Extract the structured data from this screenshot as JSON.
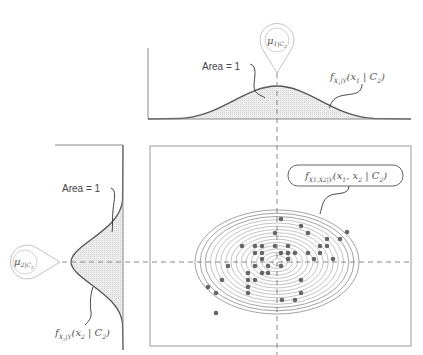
{
  "top_panel": {
    "area_label": "Area = 1",
    "mean_marker": {
      "symbol": "μ",
      "subscript": "1|C",
      "subsub": "2"
    },
    "curve_label": {
      "f": "f",
      "sub": "X",
      "subsub": "1",
      "sub2": "|Y",
      "args": "(x",
      "arg_sub": "1",
      "rest": " | C",
      "rest_sub": "2",
      "close": ")"
    }
  },
  "left_panel": {
    "area_label": "Area = 1",
    "mean_marker": {
      "symbol": "μ",
      "subscript": "2|C",
      "subsub": "2"
    },
    "curve_label": {
      "f": "f",
      "sub": "X",
      "subsub": "2",
      "sub2": "|Y",
      "args": "(x",
      "arg_sub": "2",
      "rest": " | C",
      "rest_sub": "2",
      "close": ")"
    }
  },
  "main_panel": {
    "joint_label": {
      "f": "f",
      "sub": "X1,X2|Y",
      "args": "(x",
      "arg1_sub": "1",
      "mid": ", x",
      "arg2_sub": "2",
      "rest": " | C",
      "rest_sub": "2",
      "close": ")"
    },
    "ellipse": {
      "cx": 277,
      "cy": 262,
      "rx": 82,
      "ry": 52,
      "rings": 16
    },
    "points": [
      [
        281,
        219
      ],
      [
        301,
        226
      ],
      [
        347,
        232
      ],
      [
        275,
        233
      ],
      [
        308,
        233
      ],
      [
        340,
        239
      ],
      [
        327,
        239
      ],
      [
        242,
        246
      ],
      [
        255,
        246
      ],
      [
        262,
        246
      ],
      [
        275,
        246
      ],
      [
        288,
        246
      ],
      [
        320,
        246
      ],
      [
        327,
        246
      ],
      [
        255,
        253
      ],
      [
        262,
        253
      ],
      [
        281,
        253
      ],
      [
        288,
        253
      ],
      [
        295,
        253
      ],
      [
        308,
        253
      ],
      [
        320,
        253
      ],
      [
        262,
        259
      ],
      [
        288,
        259
      ],
      [
        314,
        259
      ],
      [
        333,
        259
      ],
      [
        228,
        266
      ],
      [
        255,
        266
      ],
      [
        268,
        266
      ],
      [
        281,
        266
      ],
      [
        248,
        273
      ],
      [
        262,
        273
      ],
      [
        268,
        273
      ],
      [
        222,
        280
      ],
      [
        248,
        280
      ],
      [
        255,
        280
      ],
      [
        301,
        280
      ],
      [
        208,
        287
      ],
      [
        248,
        287
      ],
      [
        216,
        293
      ],
      [
        248,
        293
      ],
      [
        301,
        293
      ],
      [
        282,
        300
      ],
      [
        295,
        300
      ],
      [
        216,
        313
      ]
    ]
  },
  "colors": {
    "axis": "#777777",
    "curve": "#555555",
    "fill": "#e6e6e6",
    "marker": "#bbbbbb",
    "point": "#666666",
    "contour": "#999999"
  }
}
